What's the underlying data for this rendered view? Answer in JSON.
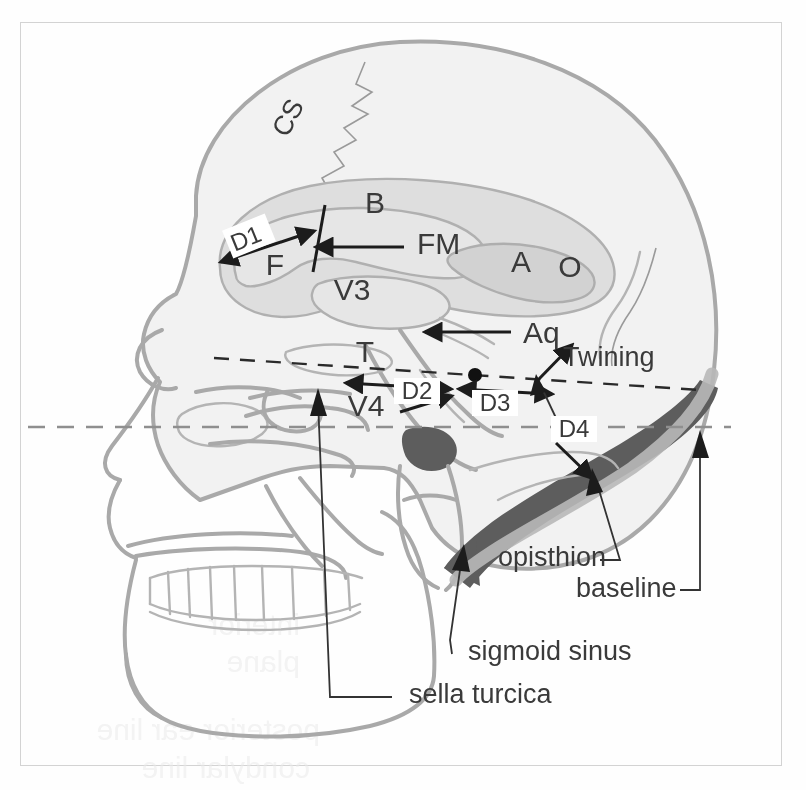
{
  "figure": {
    "frame_border_color": "#d3d3d3",
    "background_color": "#fefefe"
  },
  "colors": {
    "text": "#3a3a3a",
    "bone_outline": "#a9a9a9",
    "skull_fill": "#f2f2f2",
    "brain_fill": "#dedede",
    "ventricle_fill": "#e6e6e6",
    "sigmoid_sinus": "#5d5d5d",
    "twining_line": "#2a2a2a",
    "baseline": "#8f8f8f",
    "leader": "#333333"
  },
  "abbreviation_labels": [
    {
      "id": "cs",
      "text": "CS",
      "name": "coronal-suture",
      "x": 296,
      "y": 122,
      "rotate": -62,
      "size": 27
    },
    {
      "id": "b",
      "text": "B",
      "name": "body-lateral-ventricle",
      "x": 375,
      "y": 213,
      "rotate": 0,
      "size": 30
    },
    {
      "id": "f",
      "text": "F",
      "name": "frontal-horn",
      "x": 275,
      "y": 275,
      "rotate": 0,
      "size": 30
    },
    {
      "id": "v3",
      "text": "V3",
      "name": "third-ventricle",
      "x": 352,
      "y": 300,
      "rotate": 0,
      "size": 30
    },
    {
      "id": "a",
      "text": "A",
      "name": "atrium",
      "x": 521,
      "y": 272,
      "rotate": 0,
      "size": 30
    },
    {
      "id": "o",
      "text": "O",
      "name": "occipital-horn",
      "x": 570,
      "y": 277,
      "rotate": 0,
      "size": 30
    },
    {
      "id": "t",
      "text": "T",
      "name": "temporal-horn",
      "x": 365,
      "y": 362,
      "rotate": 0,
      "size": 30
    },
    {
      "id": "v4",
      "text": "V4",
      "name": "fourth-ventricle",
      "x": 366,
      "y": 416,
      "rotate": 0,
      "size": 30
    }
  ],
  "arrow_labels": [
    {
      "id": "fm",
      "text": "FM",
      "name": "foramen-of-monro",
      "x": 417,
      "y": 254,
      "size": 30
    },
    {
      "id": "aq",
      "text": "Aq",
      "name": "cerebral-aqueduct",
      "x": 523,
      "y": 343,
      "size": 30
    }
  ],
  "dimension_labels": [
    {
      "id": "d1",
      "text": "D1",
      "name": "dimension-d1",
      "x": 243,
      "y": 242,
      "rotate": -22,
      "size": 24
    },
    {
      "id": "d2",
      "text": "D2",
      "name": "dimension-d2",
      "x": 408,
      "y": 394,
      "rotate": 0,
      "size": 24
    },
    {
      "id": "d3",
      "text": "D3",
      "name": "dimension-d3",
      "x": 486,
      "y": 406,
      "rotate": 0,
      "size": 24
    },
    {
      "id": "d4",
      "text": "D4",
      "name": "dimension-d4",
      "x": 565,
      "y": 432,
      "rotate": 0,
      "size": 24
    }
  ],
  "line_labels": [
    {
      "id": "twining",
      "text": "Twining",
      "name": "twining-line-label",
      "x": 563,
      "y": 366,
      "size": 27
    },
    {
      "id": "baseline",
      "text": "baseline",
      "name": "baseline-label",
      "x": 576,
      "y": 597,
      "size": 27
    }
  ],
  "anatomy_labels": [
    {
      "id": "opisthion",
      "text": "opisthion",
      "name": "opisthion-label",
      "x": 498,
      "y": 566,
      "size": 27
    },
    {
      "id": "sigmoid_sinus",
      "text": "sigmoid sinus",
      "name": "sigmoid-sinus-label",
      "x": 468,
      "y": 660,
      "size": 27
    },
    {
      "id": "sella_turcica",
      "text": "sella turcica",
      "name": "sella-turcica-label",
      "x": 409,
      "y": 703,
      "size": 27
    }
  ],
  "reference_lines": [
    {
      "id": "twining_line",
      "name": "twining-line",
      "style": "dashed-black",
      "x1": 214,
      "y1": 358,
      "x2": 700,
      "y2": 390
    },
    {
      "id": "baseline_line",
      "name": "baseline-line",
      "style": "dashed-gray",
      "x1": 28,
      "y1": 427,
      "x2": 731,
      "y2": 427
    }
  ]
}
